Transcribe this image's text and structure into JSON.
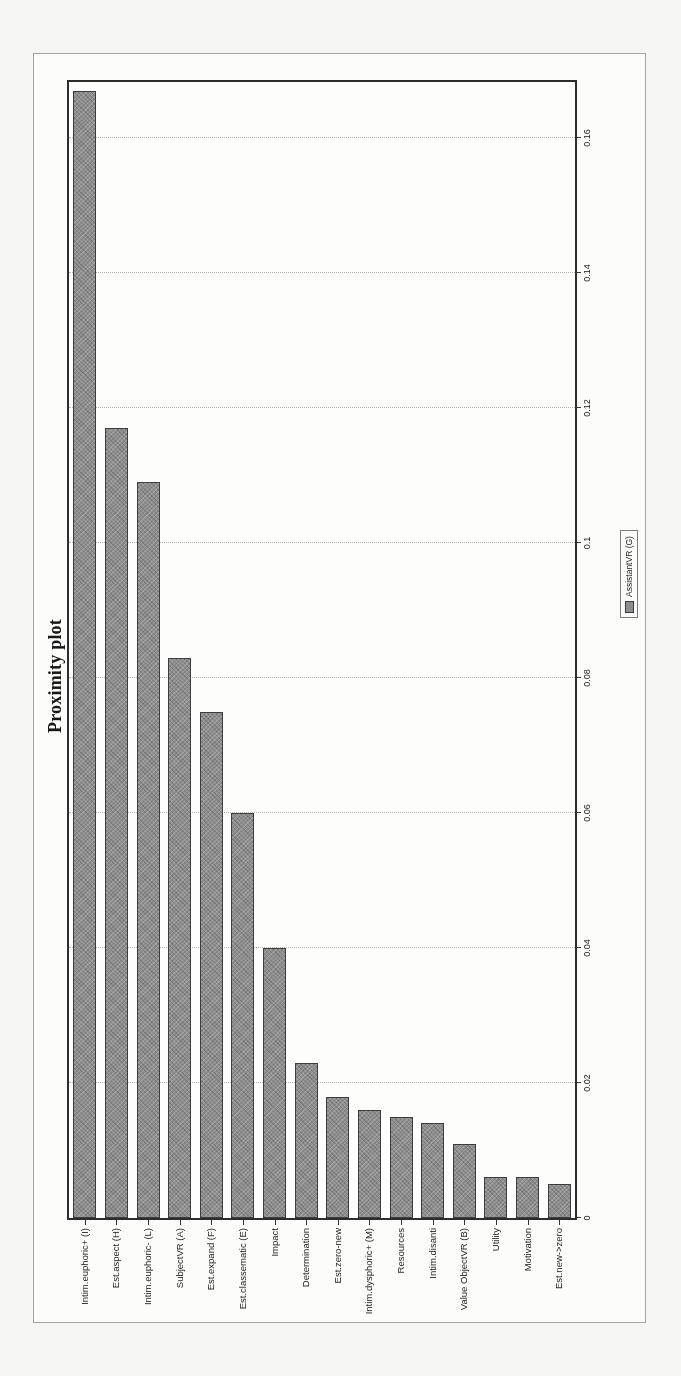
{
  "chart_data": {
    "type": "bar",
    "orientation": "horizontal",
    "presentation": "entire chart rotated 90deg counter-clockwise on the page",
    "title": "Proximity plot",
    "categories": [
      "Intim.euphoric+ (I)",
      "Est.aspect (H)",
      "Intim.euphoric- (L)",
      "SubjectVR (A)",
      "Est.expand (F)",
      "Est.classematic (E)",
      "Impact",
      "Determination",
      "Est.zero-new",
      "Intim.dysphoric+ (M)",
      "Resources",
      "Intim.disanti",
      "Value ObjectVR (B)",
      "Utility",
      "Motivation",
      "Est.new->zero"
    ],
    "series": [
      {
        "name": "AssistantVR (G)",
        "values": [
          0.167,
          0.117,
          0.109,
          0.083,
          0.075,
          0.06,
          0.04,
          0.023,
          0.018,
          0.016,
          0.015,
          0.014,
          0.011,
          0.006,
          0.006,
          0.005
        ]
      }
    ],
    "value_axis": {
      "min": 0,
      "max": 0.169,
      "tick_values": [
        0,
        0.02,
        0.04,
        0.06,
        0.08,
        0.1,
        0.12,
        0.14,
        0.16
      ],
      "tick_labels": [
        "0",
        "0.02",
        "0.04",
        "0.06",
        "0.08",
        "0.1",
        "0.12",
        "0.14",
        "0.16"
      ]
    },
    "grid": "dotted lines at value ticks",
    "legend": {
      "label": "AssistantVR (G)",
      "position": "below value axis",
      "swatch_color": "#8e8e8e"
    },
    "bar_color": "#8e8e8e",
    "bar_border_color": "#3d3d3d"
  }
}
